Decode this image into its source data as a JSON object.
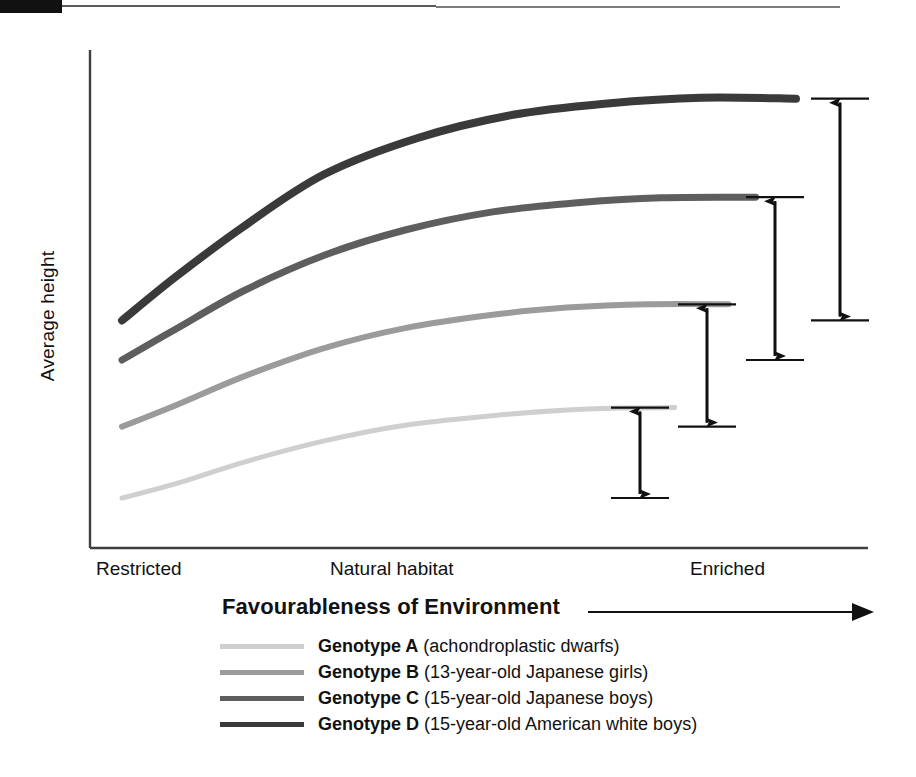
{
  "page": {
    "corner_mark": "black-bar",
    "top_rule": "horizontal-rule"
  },
  "chart_data": {
    "type": "line",
    "title": "",
    "xlabel": "Favourableness of Environment",
    "ylabel": "Average height",
    "x_tick_labels": [
      "Restricted",
      "Natural habitat",
      "Enriched"
    ],
    "y_tick_labels": [],
    "grid": false,
    "legend_position": "bottom",
    "axis_note": "Axes are unlabelled/qualitative — no numeric scale shown",
    "arrow_annotation_label": "→",
    "series": [
      {
        "name": "Genotype A",
        "description": "(achondroplastic dwarfs)",
        "color": "#cfcfcf",
        "line_width": 5,
        "x": [
          0.0,
          0.08,
          0.18,
          0.3,
          0.42,
          0.55,
          0.66,
          0.74,
          0.82
        ],
        "y": [
          0.105,
          0.135,
          0.18,
          0.225,
          0.258,
          0.278,
          0.29,
          0.294,
          0.295
        ],
        "start_value": 0.105,
        "plateau_value": 0.295,
        "range": 0.19
      },
      {
        "name": "Genotype B",
        "description": "(13-year-old Japanese girls)",
        "color": "#9b9b9b",
        "line_width": 6,
        "x": [
          0.0,
          0.08,
          0.18,
          0.3,
          0.42,
          0.55,
          0.66,
          0.78,
          0.9
        ],
        "y": [
          0.255,
          0.3,
          0.36,
          0.42,
          0.462,
          0.49,
          0.505,
          0.512,
          0.512
        ],
        "start_value": 0.255,
        "plateau_value": 0.512,
        "range": 0.257
      },
      {
        "name": "Genotype C",
        "description": "(15-year-old Japanese boys)",
        "color": "#5e5e5e",
        "line_width": 7,
        "x": [
          0.0,
          0.08,
          0.18,
          0.3,
          0.42,
          0.55,
          0.68,
          0.8,
          0.94
        ],
        "y": [
          0.395,
          0.46,
          0.54,
          0.615,
          0.668,
          0.706,
          0.726,
          0.736,
          0.737
        ],
        "start_value": 0.395,
        "plateau_value": 0.737,
        "range": 0.342
      },
      {
        "name": "Genotype D",
        "description": "(15-year-old American white boys)",
        "color": "#3a3a3a",
        "line_width": 8,
        "x": [
          0.0,
          0.08,
          0.18,
          0.3,
          0.44,
          0.58,
          0.72,
          0.86,
          1.0
        ],
        "y": [
          0.478,
          0.57,
          0.675,
          0.785,
          0.862,
          0.91,
          0.934,
          0.946,
          0.944
        ],
        "start_value": 0.478,
        "plateau_value": 0.944,
        "range": 0.466
      }
    ],
    "range_annotations": [
      {
        "name": "range-genotype-A",
        "series": "Genotype A",
        "top": 0.295,
        "bottom": 0.105
      },
      {
        "name": "range-genotype-B",
        "series": "Genotype B",
        "top": 0.512,
        "bottom": 0.255
      },
      {
        "name": "range-genotype-C",
        "series": "Genotype C",
        "top": 0.737,
        "bottom": 0.395
      },
      {
        "name": "range-genotype-D",
        "series": "Genotype D",
        "top": 0.944,
        "bottom": 0.478
      }
    ]
  },
  "axis": {
    "x_title": "Favourableness of Environment",
    "y_title": "Average height",
    "ticks": {
      "restricted": "Restricted",
      "natural": "Natural habitat",
      "enriched": "Enriched"
    }
  },
  "legend": {
    "items": [
      {
        "name": "Genotype A",
        "desc": " (achondroplastic dwarfs)",
        "color": "#cfcfcf"
      },
      {
        "name": "Genotype B",
        "desc": " (13-year-old Japanese girls)",
        "color": "#9b9b9b"
      },
      {
        "name": "Genotype C",
        "desc": " (15-year-old Japanese boys)",
        "color": "#5e5e5e"
      },
      {
        "name": "Genotype D",
        "desc": " (15-year-old American white boys)",
        "color": "#3a3a3a"
      }
    ]
  }
}
